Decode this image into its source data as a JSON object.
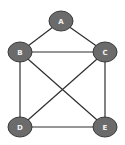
{
  "diagram": {
    "type": "undirected-graph",
    "colors": {
      "node_fill": "#6b6b6b",
      "node_stroke": "#3a3a3a",
      "edge": "#2e2e2e",
      "label": "#f2f2f2",
      "background": "#ffffff"
    },
    "nodes": [
      {
        "id": "A",
        "label": "A",
        "x": 61,
        "y": 21
      },
      {
        "id": "B",
        "label": "B",
        "x": 20,
        "y": 52
      },
      {
        "id": "C",
        "label": "C",
        "x": 105,
        "y": 52
      },
      {
        "id": "D",
        "label": "D",
        "x": 20,
        "y": 127
      },
      {
        "id": "E",
        "label": "E",
        "x": 105,
        "y": 127
      }
    ],
    "edges": [
      {
        "from": "A",
        "to": "B"
      },
      {
        "from": "A",
        "to": "C"
      },
      {
        "from": "B",
        "to": "C"
      },
      {
        "from": "B",
        "to": "D"
      },
      {
        "from": "B",
        "to": "E"
      },
      {
        "from": "C",
        "to": "D"
      },
      {
        "from": "C",
        "to": "E"
      },
      {
        "from": "D",
        "to": "E"
      }
    ]
  }
}
